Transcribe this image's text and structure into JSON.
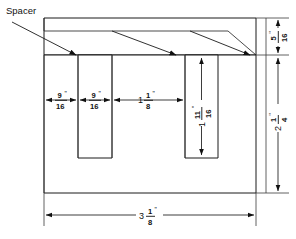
{
  "drawing": {
    "title_label": "Spacer",
    "units_note": "\"",
    "parts": {
      "body_name": "spacer-body",
      "slot_left_name": "left-slot",
      "slot_right_name": "right-slot",
      "spacer_strip_name": "spacer-top-strip"
    },
    "dimensions": {
      "left_margin": {
        "whole": "",
        "num": "9",
        "den": "16",
        "mark": "\"",
        "full": "9/16\""
      },
      "slot_width": {
        "whole": "",
        "num": "9",
        "den": "16",
        "mark": "\"",
        "full": "9/16\""
      },
      "between_slots": {
        "whole": "1",
        "num": "1",
        "den": "8",
        "mark": "\"",
        "full": "1 1/8\""
      },
      "slot_depth": {
        "whole": "1",
        "num": "11",
        "den": "16",
        "mark": "\"",
        "full": "1 11/16\""
      },
      "strip_thickness": {
        "whole": "",
        "num": "5",
        "den": "16",
        "mark": "\"",
        "full": "5/16\""
      },
      "overall_height": {
        "whole": "2",
        "num": "1",
        "den": "4",
        "mark": "\"",
        "full": "2 1/4\""
      },
      "overall_width": {
        "whole": "3",
        "num": "1",
        "den": "8",
        "mark": "\"",
        "full": "3 1/8\""
      }
    }
  }
}
